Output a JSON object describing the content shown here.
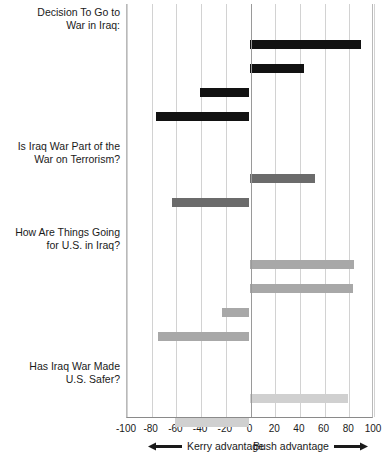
{
  "chart_data": {
    "type": "bar",
    "orientation": "horizontal",
    "title": "",
    "xlabel": "",
    "ylabel": "",
    "xlim": [
      -100,
      100
    ],
    "xticks": [
      -100,
      -80,
      -60,
      -40,
      -20,
      0,
      20,
      40,
      60,
      80,
      100
    ],
    "xtick_labels": [
      "-100",
      "-80",
      "-60",
      "-40",
      "-20",
      "0",
      "20",
      "40",
      "60",
      "80",
      "100"
    ],
    "grid": true,
    "legend": "none",
    "zero_reference": 0,
    "annotations": {
      "left_caption": "Kerry advantage",
      "right_caption": "Bush advantage",
      "left_arrow": "left-arrow-icon",
      "right_arrow": "right-arrow-icon"
    },
    "groups": [
      {
        "heading": [
          "Decision To Go to",
          "War in Iraq:"
        ],
        "color": "#121212",
        "categories": [
          "Approve strongly (29%)",
          "Approve somewhat (23%)",
          "Disapprove somewhat (15%)",
          "Disapprove strongly (31%)"
        ],
        "values": [
          90,
          44,
          -40,
          -76
        ]
      },
      {
        "heading": [
          "Is Iraq War Part of the",
          "War on Terrorism?"
        ],
        "color": "#6b6b6b",
        "categories": [
          "Yes (55%)",
          "No (45%)"
        ],
        "values": [
          53,
          -63
        ]
      },
      {
        "heading": [
          "How Are Things Going",
          "for U.S. in Iraq?"
        ],
        "color": "#a8a8a8",
        "categories": [
          "Very well (11%)",
          "Somewhat well (34%)",
          "Somewhat badly (20%)",
          "Very badly (33%)"
        ],
        "values": [
          85,
          84,
          -22,
          -74
        ]
      },
      {
        "heading": [
          "Has Iraq War Made",
          "U.S. Safer?"
        ],
        "color": "#d0d0d0",
        "categories": [
          "Yes (46%)",
          "No (52%)"
        ],
        "values": [
          80,
          -60
        ]
      }
    ]
  }
}
